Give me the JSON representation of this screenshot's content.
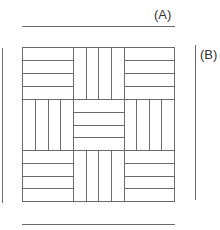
{
  "labels": {
    "a": "(A)",
    "b": "(B)"
  },
  "colors": {
    "line": "#6b6b6b",
    "text": "#333333",
    "background": "#ffffff"
  },
  "pattern": {
    "description": "3x3 parquet basket-weave tile; each block has 4 strips",
    "strips_per_block": 4,
    "rows": [
      [
        "horizontal",
        "vertical",
        "horizontal"
      ],
      [
        "vertical",
        "horizontal",
        "vertical"
      ],
      [
        "horizontal",
        "vertical",
        "horizontal"
      ]
    ]
  }
}
